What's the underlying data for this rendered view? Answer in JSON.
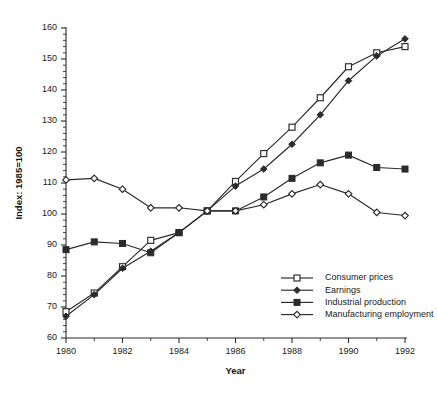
{
  "chart_data": {
    "type": "line",
    "title": "",
    "xlabel": "Year",
    "ylabel": "Index: 1985=100",
    "xlim": [
      1980,
      1992
    ],
    "ylim": [
      60,
      160
    ],
    "ytick_step": 10,
    "yminor_step": 2,
    "xtick_step": 2,
    "xminor_step": 1,
    "grid": false,
    "legend_position": "inside-lower-right",
    "x": [
      1980,
      1981,
      1982,
      1983,
      1984,
      1985,
      1986,
      1987,
      1988,
      1989,
      1990,
      1991,
      1992
    ],
    "xtick_labels": [
      "1980",
      "1982",
      "1984",
      "1986",
      "1988",
      "1990",
      "1992"
    ],
    "ytick_labels": [
      "60",
      "70",
      "80",
      "90",
      "100",
      "110",
      "120",
      "130",
      "140",
      "150",
      "160"
    ],
    "series": [
      {
        "name": "Consumer prices",
        "marker": "open-square",
        "values": [
          68.5,
          74.5,
          83.0,
          91.5,
          94.0,
          101.0,
          110.5,
          119.5,
          128.0,
          137.5,
          147.5,
          152.0,
          154.0
        ]
      },
      {
        "name": "Earnings",
        "marker": "filled-diamond",
        "values": [
          67.0,
          74.0,
          82.5,
          88.0,
          94.0,
          101.0,
          109.0,
          114.5,
          122.5,
          132.0,
          143.0,
          151.0,
          156.5
        ]
      },
      {
        "name": "Industrial production",
        "marker": "filled-square",
        "values": [
          88.5,
          91.0,
          90.5,
          87.5,
          94.0,
          101.0,
          101.0,
          105.5,
          111.5,
          116.5,
          119.0,
          115.0,
          114.5
        ]
      },
      {
        "name": "Manufacturing employment",
        "marker": "open-diamond",
        "values": [
          111.0,
          111.5,
          108.0,
          102.0,
          102.0,
          101.0,
          101.0,
          103.0,
          106.5,
          109.5,
          106.5,
          100.5,
          99.5
        ]
      }
    ]
  }
}
